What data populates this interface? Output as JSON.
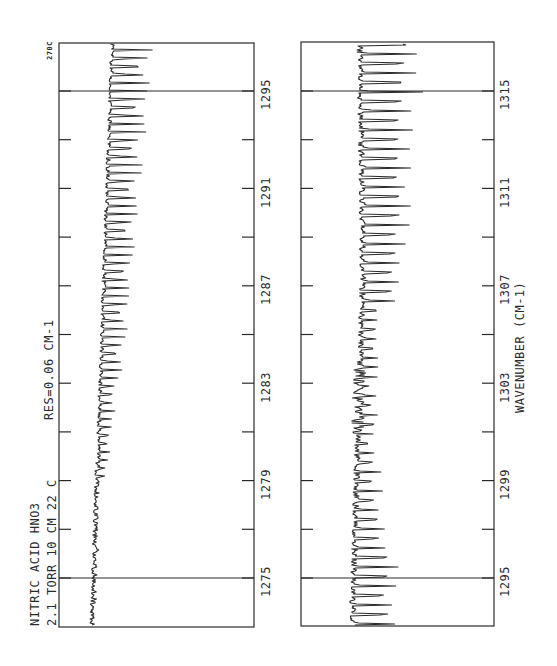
{
  "chart_data": [
    {
      "type": "line",
      "panel": "top",
      "title": "NITRIC ACID  HNO3",
      "subtitle": "2.1 TORR  10 CM  22 C",
      "annotation": "RES=0.06 CM-1",
      "corner_label": "270C",
      "xlabel": "",
      "ylabel": "Transmittance (unlabeled)",
      "xlim": [
        1273.5,
        1297
      ],
      "ticks": [
        1275,
        1277,
        1279,
        1281,
        1283,
        1285,
        1287,
        1289,
        1291,
        1293,
        1295
      ],
      "tick_labels": [
        "1275",
        "1279",
        "1283",
        "1287",
        "1291",
        "1295"
      ],
      "reference_lines": [
        1275,
        1295
      ],
      "orientation": "rotated 90deg (wavenumber increases upward)",
      "description": "Absorption spectrum; small noisy absorptions near 1275, growing regular line series (amplitude increasing) toward 1295 and beyond"
    },
    {
      "type": "line",
      "panel": "bottom",
      "xlabel": "WAVENUMBER (CM-1)",
      "xlim": [
        1293.5,
        1317
      ],
      "ticks": [
        1295,
        1297,
        1299,
        1301,
        1303,
        1305,
        1307,
        1309,
        1311,
        1313,
        1315
      ],
      "tick_labels": [
        "1295",
        "1299",
        "1303",
        "1307",
        "1311",
        "1315"
      ],
      "reference_lines": [
        1295,
        1315
      ],
      "orientation": "rotated 90deg (wavenumber increases upward)",
      "description": "Absorption spectrum continuation; strong regular lines near 1295, dense blended band center near 1302-1303, strong irregular lines 1307-1317"
    }
  ],
  "labels": {
    "title_line1": "NITRIC ACID  HNO3",
    "title_line2": "2.1 TORR  10 CM  22 C",
    "resolution": "RES=0.06 CM-1",
    "corner": "270C",
    "xaxis": "WAVENUMBER (CM-1)"
  },
  "top_ticks": [
    "1275",
    "1279",
    "1283",
    "1287",
    "1291",
    "1295"
  ],
  "bottom_ticks": [
    "1295",
    "1299",
    "1303",
    "1307",
    "1311",
    "1315"
  ],
  "colors": {
    "ink": "#2a2a2a",
    "background": "#ffffff"
  }
}
